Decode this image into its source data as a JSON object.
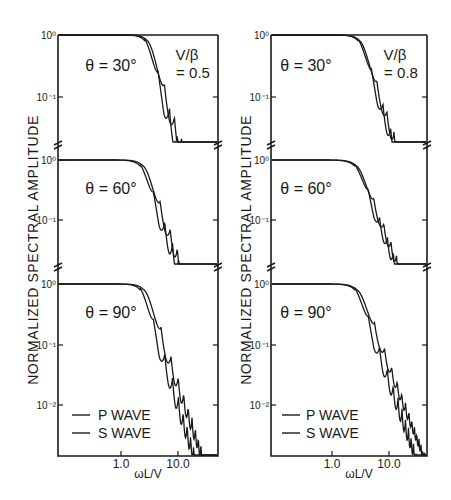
{
  "chart_data": [
    {
      "type": "line",
      "panel": "left",
      "title": "V/β = 0.5",
      "param_label": "V/β",
      "param_value": "= 0.5",
      "ylabel": "NORMALIZED SPECTRAL AMPLITUDE",
      "xlabel": "ωL/V",
      "xscale": "log",
      "yscale": "log",
      "xlim": [
        0.08,
        50
      ],
      "x_ticks": [
        {
          "value": 1.0,
          "label": "1.0"
        },
        {
          "value": 10.0,
          "label": "10.0"
        }
      ],
      "legend": {
        "position": "lower-left (bottom subplot)",
        "entries": [
          "P WAVE",
          "S WAVE"
        ]
      },
      "grid": false,
      "subplots": [
        {
          "label": "θ = 30°",
          "ylim": [
            0.03,
            1
          ],
          "y_ticks": [
            {
              "value": 1,
              "label": "10⁰"
            },
            {
              "value": 0.1,
              "label": "10⁻¹"
            }
          ],
          "note": "approximate trace, not digitized",
          "series": [
            {
              "name": "P WAVE",
              "x": [
                0.1,
                1.0,
                2.0,
                3.0,
                4.0,
                6.0,
                8.0,
                10.0,
                15.0,
                20.0,
                30.0,
                40.0
              ],
              "y": [
                1.0,
                1.0,
                0.97,
                0.85,
                0.55,
                0.18,
                0.07,
                0.04,
                0.05,
                0.03,
                0.04,
                0.02
              ]
            },
            {
              "name": "S WAVE",
              "x": [
                0.1,
                1.0,
                2.0,
                3.0,
                4.0,
                6.0,
                8.0,
                10.0,
                15.0,
                20.0,
                30.0,
                40.0
              ],
              "y": [
                1.0,
                1.0,
                0.95,
                0.78,
                0.45,
                0.12,
                0.05,
                0.03,
                0.04,
                0.02,
                0.03,
                0.015
              ]
            }
          ]
        },
        {
          "label": "θ = 60°",
          "ylim": [
            0.03,
            1
          ],
          "y_ticks": [
            {
              "value": 1,
              "label": "10⁰"
            },
            {
              "value": 0.1,
              "label": "10⁻¹"
            }
          ],
          "note": "approximate trace, not digitized",
          "series": [
            {
              "name": "P WAVE",
              "x": [
                0.1,
                1.0,
                2.0,
                3.0,
                4.0,
                5.0,
                6.0,
                8.0,
                10.0,
                15.0,
                20.0,
                30.0,
                40.0
              ],
              "y": [
                1.0,
                0.98,
                0.85,
                0.55,
                0.3,
                0.18,
                0.1,
                0.06,
                0.05,
                0.04,
                0.03,
                0.02,
                0.015
              ]
            },
            {
              "name": "S WAVE",
              "x": [
                0.1,
                1.0,
                2.0,
                3.0,
                4.0,
                5.0,
                6.0,
                8.0,
                10.0,
                15.0,
                20.0,
                30.0,
                40.0
              ],
              "y": [
                1.0,
                0.98,
                0.8,
                0.48,
                0.25,
                0.11,
                0.08,
                0.05,
                0.035,
                0.03,
                0.02,
                0.015,
                0.01
              ]
            }
          ]
        },
        {
          "label": "θ = 90°",
          "ylim": [
            0.003,
            1
          ],
          "y_ticks": [
            {
              "value": 1,
              "label": "10⁰"
            },
            {
              "value": 0.1,
              "label": "10⁻¹"
            },
            {
              "value": 0.01,
              "label": "10⁻²"
            }
          ],
          "note": "approximate trace, not digitized",
          "series": [
            {
              "name": "P WAVE",
              "x": [
                0.1,
                1.0,
                2.0,
                3.0,
                4.0,
                6.0,
                8.0,
                10.0,
                12.0,
                15.0,
                20.0,
                30.0,
                40.0
              ],
              "y": [
                1.0,
                0.98,
                0.85,
                0.55,
                0.3,
                0.12,
                0.1,
                0.05,
                0.04,
                0.03,
                0.015,
                0.008,
                0.005
              ]
            },
            {
              "name": "S WAVE",
              "x": [
                0.1,
                1.0,
                2.0,
                3.0,
                4.0,
                6.0,
                8.0,
                10.0,
                12.0,
                15.0,
                20.0,
                30.0,
                40.0
              ],
              "y": [
                1.0,
                0.97,
                0.78,
                0.45,
                0.2,
                0.1,
                0.09,
                0.03,
                0.03,
                0.02,
                0.01,
                0.005,
                0.003
              ]
            }
          ]
        }
      ]
    },
    {
      "type": "line",
      "panel": "right",
      "title": "V/β = 0.8",
      "param_label": "V/β",
      "param_value": "= 0.8",
      "ylabel": "NORMALIZED SPECTRAL AMPLITUDE",
      "xlabel": "ωL/V",
      "xscale": "log",
      "yscale": "log",
      "xlim": [
        0.08,
        50
      ],
      "x_ticks": [
        {
          "value": 1.0,
          "label": "1.0"
        },
        {
          "value": 10.0,
          "label": "10.0"
        }
      ],
      "legend": {
        "position": "lower-left (bottom subplot)",
        "entries": [
          "P WAVE",
          "S WAVE"
        ]
      },
      "grid": false,
      "subplots": [
        {
          "label": "θ = 30°",
          "ylim": [
            0.03,
            1
          ],
          "y_ticks": [
            {
              "value": 1,
              "label": "10⁰"
            },
            {
              "value": 0.1,
              "label": "10⁻¹"
            }
          ],
          "note": "approximate trace, not digitized",
          "series": [
            {
              "name": "P WAVE",
              "x": [
                0.1,
                1.0,
                2.0,
                3.0,
                4.0,
                6.0,
                8.0,
                10.0,
                15.0,
                20.0,
                30.0,
                40.0
              ],
              "y": [
                1.0,
                1.0,
                0.95,
                0.75,
                0.45,
                0.15,
                0.08,
                0.05,
                0.04,
                0.03,
                0.02,
                0.015
              ]
            },
            {
              "name": "S WAVE",
              "x": [
                0.1,
                1.0,
                2.0,
                3.0,
                4.0,
                6.0,
                8.0,
                10.0,
                15.0,
                20.0,
                30.0,
                40.0
              ],
              "y": [
                1.0,
                1.0,
                0.93,
                0.7,
                0.4,
                0.12,
                0.07,
                0.04,
                0.03,
                0.025,
                0.015,
                0.01
              ]
            }
          ]
        },
        {
          "label": "θ = 60°",
          "ylim": [
            0.03,
            1
          ],
          "y_ticks": [
            {
              "value": 1,
              "label": "10⁰"
            },
            {
              "value": 0.1,
              "label": "10⁻¹"
            }
          ],
          "note": "approximate trace, not digitized",
          "series": [
            {
              "name": "P WAVE",
              "x": [
                0.1,
                1.0,
                2.0,
                3.0,
                4.0,
                6.0,
                8.0,
                10.0,
                15.0,
                20.0,
                30.0,
                40.0
              ],
              "y": [
                1.0,
                0.98,
                0.85,
                0.6,
                0.35,
                0.2,
                0.12,
                0.08,
                0.05,
                0.03,
                0.02,
                0.015
              ]
            },
            {
              "name": "S WAVE",
              "x": [
                0.1,
                1.0,
                2.0,
                3.0,
                4.0,
                6.0,
                8.0,
                10.0,
                15.0,
                20.0,
                30.0,
                40.0
              ],
              "y": [
                1.0,
                0.98,
                0.82,
                0.55,
                0.3,
                0.18,
                0.11,
                0.07,
                0.04,
                0.025,
                0.015,
                0.012
              ]
            }
          ]
        },
        {
          "label": "θ = 90°",
          "ylim": [
            0.003,
            1
          ],
          "y_ticks": [
            {
              "value": 1,
              "label": "10⁰"
            },
            {
              "value": 0.1,
              "label": "10⁻¹"
            },
            {
              "value": 0.01,
              "label": "10⁻²"
            }
          ],
          "note": "approximate trace, not digitized",
          "series": [
            {
              "name": "P WAVE",
              "x": [
                0.1,
                1.0,
                2.0,
                3.0,
                4.0,
                6.0,
                8.0,
                10.0,
                12.0,
                15.0,
                20.0,
                30.0,
                40.0
              ],
              "y": [
                1.0,
                0.98,
                0.88,
                0.6,
                0.35,
                0.18,
                0.12,
                0.1,
                0.06,
                0.04,
                0.02,
                0.01,
                0.005
              ]
            },
            {
              "name": "S WAVE",
              "x": [
                0.1,
                1.0,
                2.0,
                3.0,
                4.0,
                6.0,
                8.0,
                10.0,
                12.0,
                15.0,
                20.0,
                30.0,
                40.0
              ],
              "y": [
                1.0,
                0.97,
                0.82,
                0.5,
                0.2,
                0.16,
                0.1,
                0.08,
                0.04,
                0.025,
                0.012,
                0.006,
                0.004
              ]
            }
          ]
        }
      ]
    }
  ],
  "labels": {
    "ylabel": "NORMALIZED SPECTRAL AMPLITUDE",
    "xlabel": "ωL/V",
    "legend_p": "P WAVE",
    "legend_s": "S WAVE",
    "left_param_top": "V/β",
    "left_param_bottom": "= 0.5",
    "right_param_top": "V/β",
    "right_param_bottom": "= 0.8",
    "theta_30": "θ = 30°",
    "theta_60": "θ = 60°",
    "theta_90": "θ = 90°",
    "tick_1": "1.0",
    "tick_10": "10.0",
    "y_1e0": "10⁰",
    "y_1e-1": "10⁻¹",
    "y_1e-2": "10⁻²"
  },
  "colors": {
    "ink": "#1a1a1a",
    "background": "#ffffff"
  }
}
